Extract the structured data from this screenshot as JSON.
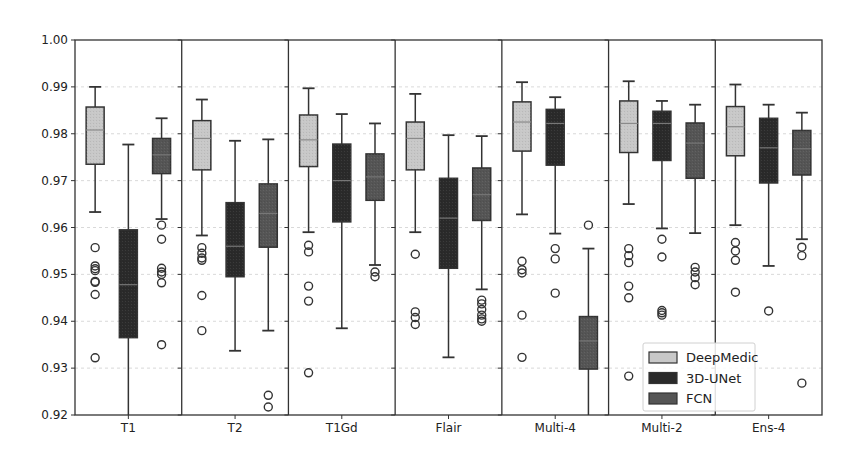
{
  "chart_data": {
    "type": "box",
    "title": "",
    "xlabel": "",
    "ylabel": "",
    "ylim": [
      0.92,
      1.0
    ],
    "yticks": [
      "0.92",
      "0.93",
      "0.94",
      "0.95",
      "0.96",
      "0.97",
      "0.98",
      "0.99",
      "1.00"
    ],
    "grid": "horizontal dashed",
    "legend_position": "lower right",
    "categories": [
      "T1",
      "T2",
      "T1Gd",
      "Flair",
      "Multi-4",
      "Multi-2",
      "Ens-4"
    ],
    "series": [
      {
        "name": "DeepMedic",
        "color": "#c8c8c8",
        "boxes": [
          {
            "whislo": 0.9633,
            "q1": 0.9735,
            "med": 0.9808,
            "q3": 0.9857,
            "whishi": 0.99,
            "fliers": [
              0.9557,
              0.9518,
              0.9512,
              0.9508,
              0.9485,
              0.9483,
              0.9457,
              0.9322
            ]
          },
          {
            "whislo": 0.9583,
            "q1": 0.9723,
            "med": 0.979,
            "q3": 0.9828,
            "whishi": 0.9873,
            "fliers": [
              0.9557,
              0.9545,
              0.9535,
              0.953,
              0.9455,
              0.938
            ]
          },
          {
            "whislo": 0.959,
            "q1": 0.973,
            "med": 0.9787,
            "q3": 0.984,
            "whishi": 0.9897,
            "fliers": [
              0.9562,
              0.9548,
              0.9475,
              0.9443,
              0.929
            ]
          },
          {
            "whislo": 0.959,
            "q1": 0.9723,
            "med": 0.979,
            "q3": 0.9825,
            "whishi": 0.9885,
            "fliers": [
              0.9543,
              0.942,
              0.9408,
              0.9393
            ]
          },
          {
            "whislo": 0.9628,
            "q1": 0.9763,
            "med": 0.9825,
            "q3": 0.9868,
            "whishi": 0.991,
            "fliers": [
              0.9528,
              0.951,
              0.9503,
              0.9413,
              0.9323
            ]
          },
          {
            "whislo": 0.965,
            "q1": 0.976,
            "med": 0.9822,
            "q3": 0.987,
            "whishi": 0.9912,
            "fliers": [
              0.9555,
              0.954,
              0.9525,
              0.9475,
              0.945,
              0.9283
            ]
          },
          {
            "whislo": 0.9605,
            "q1": 0.9753,
            "med": 0.9815,
            "q3": 0.9858,
            "whishi": 0.9905,
            "fliers": [
              0.9568,
              0.955,
              0.953,
              0.9462
            ]
          }
        ]
      },
      {
        "name": "3D-UNet",
        "color": "#2a2a2a",
        "boxes": [
          {
            "whislo": 0.92,
            "q1": 0.9365,
            "med": 0.9478,
            "q3": 0.9595,
            "whishi": 0.9777,
            "fliers": []
          },
          {
            "whislo": 0.9337,
            "q1": 0.9495,
            "med": 0.956,
            "q3": 0.9653,
            "whishi": 0.9785,
            "fliers": []
          },
          {
            "whislo": 0.9385,
            "q1": 0.9612,
            "med": 0.97,
            "q3": 0.9778,
            "whishi": 0.9842,
            "fliers": []
          },
          {
            "whislo": 0.9323,
            "q1": 0.9513,
            "med": 0.962,
            "q3": 0.9705,
            "whishi": 0.9797,
            "fliers": []
          },
          {
            "whislo": 0.9587,
            "q1": 0.9733,
            "med": 0.9822,
            "q3": 0.9852,
            "whishi": 0.9878,
            "fliers": [
              0.9555,
              0.9533,
              0.946
            ]
          },
          {
            "whislo": 0.9598,
            "q1": 0.9743,
            "med": 0.9822,
            "q3": 0.9848,
            "whishi": 0.987,
            "fliers": [
              0.9575,
              0.9537,
              0.9423,
              0.9418,
              0.9413
            ]
          },
          {
            "whislo": 0.9518,
            "q1": 0.9695,
            "med": 0.977,
            "q3": 0.9833,
            "whishi": 0.9862,
            "fliers": [
              0.9422
            ]
          }
        ]
      },
      {
        "name": "FCN",
        "color": "#555555",
        "boxes": [
          {
            "whislo": 0.9618,
            "q1": 0.9715,
            "med": 0.9755,
            "q3": 0.979,
            "whishi": 0.9833,
            "fliers": [
              0.9605,
              0.9575,
              0.9513,
              0.9505,
              0.95,
              0.9482,
              0.935
            ]
          },
          {
            "whislo": 0.938,
            "q1": 0.9558,
            "med": 0.963,
            "q3": 0.9693,
            "whishi": 0.9788,
            "fliers": [
              0.9242,
              0.9217
            ]
          },
          {
            "whislo": 0.952,
            "q1": 0.9658,
            "med": 0.9708,
            "q3": 0.9757,
            "whishi": 0.9822,
            "fliers": [
              0.9505,
              0.9495
            ]
          },
          {
            "whislo": 0.9468,
            "q1": 0.9615,
            "med": 0.967,
            "q3": 0.9727,
            "whishi": 0.9795,
            "fliers": [
              0.9445,
              0.9437,
              0.9425,
              0.9413,
              0.9405,
              0.94
            ]
          },
          {
            "whislo": 0.92,
            "q1": 0.9298,
            "med": 0.9358,
            "q3": 0.941,
            "whishi": 0.9555,
            "fliers": [
              0.9605
            ]
          },
          {
            "whislo": 0.9588,
            "q1": 0.9705,
            "med": 0.978,
            "q3": 0.9823,
            "whishi": 0.9862,
            "fliers": [
              0.9515,
              0.9505,
              0.9493,
              0.9478
            ]
          },
          {
            "whislo": 0.9575,
            "q1": 0.9712,
            "med": 0.9768,
            "q3": 0.9807,
            "whishi": 0.9845,
            "fliers": [
              0.9558,
              0.954,
              0.9268
            ]
          }
        ]
      }
    ]
  },
  "legend": {
    "items": [
      {
        "label": "DeepMedic",
        "color": "#c8c8c8"
      },
      {
        "label": "3D-UNet",
        "color": "#2a2a2a"
      },
      {
        "label": "FCN",
        "color": "#555555"
      }
    ]
  }
}
